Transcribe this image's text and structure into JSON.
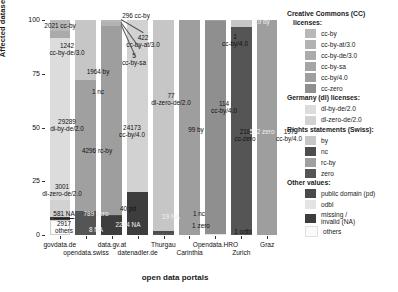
{
  "chart_data": {
    "type": "bar",
    "title": "",
    "xlabel": "open data portals",
    "ylabel": "Affected datasets (%)",
    "ylim": [
      0,
      100
    ],
    "yticks": [
      "0",
      "25",
      "50",
      "75",
      "100"
    ],
    "grid": false,
    "legend_position": "right",
    "categories": [
      "govdata.de",
      "opendata.swiss",
      "data.gv.at",
      "datenadler.de",
      "Thurgau",
      "Carinthia",
      "Opendata.HRO",
      "Zurich",
      "Graz"
    ],
    "stacks": [
      {
        "portal": "govdata.de",
        "segments": [
          {
            "label": "2021 cc-by",
            "key": "cc-by",
            "pct": 5.2
          },
          {
            "label": "1242 cc-by-de/3.0",
            "key": "cc-by-de/3.0",
            "pct": 3.2
          },
          {
            "label": "29289 di-by-de/2.0",
            "key": "dl-by-de/2.0",
            "pct": 75.3
          },
          {
            "label": "3001 dl-zero-de/2.0",
            "key": "dl-zero-de/2.0",
            "pct": 7.7
          },
          {
            "label": "581 NA",
            "key": "missing",
            "pct": 1.5
          },
          {
            "label": "2917 others",
            "key": "others",
            "pct": 7.1
          }
        ]
      },
      {
        "portal": "opendata.swiss",
        "segments": [
          {
            "label": "1964 by",
            "key": "by",
            "pct": 27.8
          },
          {
            "label": "1 nc",
            "key": "nc",
            "pct": 0.1
          },
          {
            "label": "4296 rc-by",
            "key": "rc-by",
            "pct": 60.8
          },
          {
            "label": "789 zero",
            "key": "zero",
            "pct": 11.2
          },
          {
            "label": "8 NA",
            "key": "missing",
            "pct": 0.1
          }
        ]
      },
      {
        "portal": "data.gv.at",
        "segments": [
          {
            "label": "296 cc-by",
            "key": "cc-by",
            "pct": 1.1
          },
          {
            "label": "422 cc-by-at/3.0",
            "key": "cc-by-at/3.0",
            "pct": 1.5
          },
          {
            "label": "5 cc-by-sa",
            "key": "cc-by-sa",
            "pct": 0.1
          },
          {
            "label": "24173 cc-by/4.0",
            "key": "cc-by/4.0",
            "pct": 88.2
          },
          {
            "label": "40 pd",
            "key": "pd",
            "pct": 0.2
          },
          {
            "label": "2244 NA",
            "key": "missing",
            "pct": 8.9
          }
        ]
      },
      {
        "portal": "datenadler.de",
        "segments": [
          {
            "label": "77 dl-zero-de/2.0",
            "key": "dl-zero-de/2.0",
            "pct": 80.2
          },
          {
            "label": "19 NA",
            "key": "missing",
            "pct": 19.8
          }
        ]
      },
      {
        "portal": "Thurgau",
        "segments": [
          {
            "label": "99 by",
            "key": "by",
            "pct": 98.0
          },
          {
            "label": "1 nc",
            "key": "nc",
            "pct": 1.0
          },
          {
            "label": "1 zero",
            "key": "zero",
            "pct": 1.0
          }
        ]
      },
      {
        "portal": "Carinthia",
        "segments": [
          {
            "label": "114 cc-by/4.0",
            "key": "cc-by/4.0",
            "pct": 100.0
          }
        ]
      },
      {
        "portal": "Opendata.HRO",
        "segments": [
          {
            "label": "1 cc-by/4.0",
            "key": "cc-by/4.0",
            "pct": 0.5
          },
          {
            "label": "218 cc-zero",
            "key": "cc-zero",
            "pct": 99.1
          },
          {
            "label": "1 odbl",
            "key": "odbl",
            "pct": 0.4
          }
        ]
      },
      {
        "portal": "Zurich",
        "segments": [
          {
            "label": "19 by",
            "key": "by",
            "pct": 3.4
          },
          {
            "label": "542 zero",
            "key": "zero",
            "pct": 96.6
          }
        ]
      },
      {
        "portal": "Graz",
        "segments": [
          {
            "label": "197 cc-by/4.0",
            "key": "cc-by/4.0",
            "pct": 100.0
          }
        ]
      }
    ]
  },
  "legend": {
    "groups": [
      {
        "title": "Creative Commons (CC)",
        "title2": "licenses:",
        "items": [
          {
            "label": "cc-by",
            "color": "#b8b8b8"
          },
          {
            "label": "cc-by-at/3.0",
            "color": "#b2b2b2"
          },
          {
            "label": "cc-by-de/3.0",
            "color": "#ababab"
          },
          {
            "label": "cc-by-sa",
            "color": "#a5a5a5"
          },
          {
            "label": "cc-by/4.0",
            "color": "#9e9e9e"
          },
          {
            "label": "cc-zero",
            "color": "#8f8f8f"
          }
        ]
      },
      {
        "title": "Germany (dl) licenses:",
        "title2": "",
        "items": [
          {
            "label": "dl-by-de/2.0",
            "color": "#dcdcdc"
          },
          {
            "label": "dl-zero-de/2.0",
            "color": "#d2d2d2"
          }
        ]
      },
      {
        "title": "Rights statements (Swiss):",
        "title2": "",
        "items": [
          {
            "label": "by",
            "color": "#c6c6c6"
          },
          {
            "label": "nc",
            "color": "#4d4d4d"
          },
          {
            "label": "rc-by",
            "color": "#a0a0a0"
          },
          {
            "label": "zero",
            "color": "#555555"
          }
        ]
      },
      {
        "title": "Other values:",
        "title2": "",
        "items": [
          {
            "label": "public domain (pd)",
            "color": "#4a4a4a"
          },
          {
            "label": "odbl",
            "color": "#e3e3e3"
          },
          {
            "label": "missing /\ninvalid (NA)",
            "color": "#3d3d3d"
          },
          {
            "label": "others",
            "color": "#fbfbfb"
          }
        ]
      }
    ]
  },
  "colors": {
    "cc-by": "#b8b8b8",
    "cc-by-at/3.0": "#b2b2b2",
    "cc-by-de/3.0": "#ababab",
    "cc-by-sa": "#a5a5a5",
    "cc-by/4.0": "#9e9e9e",
    "cc-zero": "#8f8f8f",
    "dl-by-de/2.0": "#dcdcdc",
    "dl-zero-de/2.0": "#d2d2d2",
    "by": "#c6c6c6",
    "nc": "#4d4d4d",
    "rc-by": "#a0a0a0",
    "zero": "#555555",
    "pd": "#4a4a4a",
    "odbl": "#e3e3e3",
    "missing": "#3d3d3d",
    "others": "#fbfbfb"
  }
}
